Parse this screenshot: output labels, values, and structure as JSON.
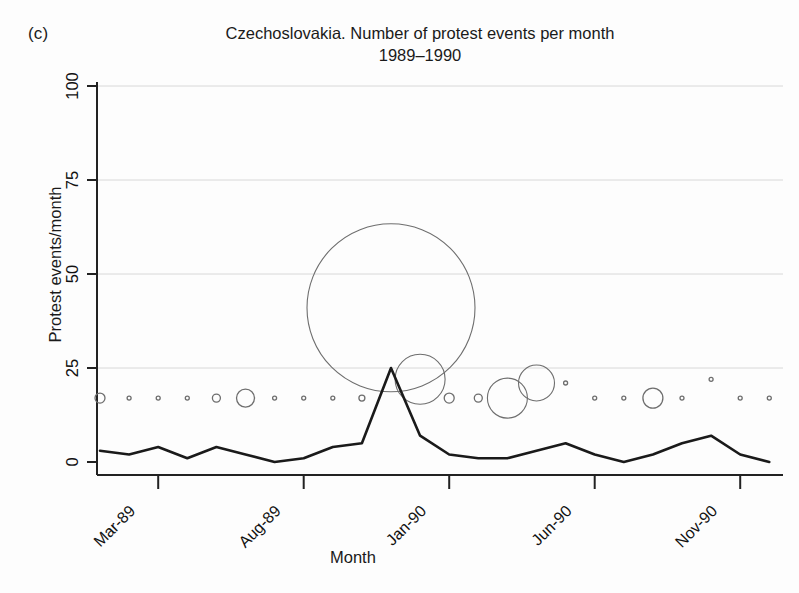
{
  "panel": {
    "label": "(c)"
  },
  "chart_data": {
    "type": "line",
    "title": "Czechoslovakia. Number of protest events per month",
    "subtitle": "1989–1990",
    "xlabel": "Month",
    "ylabel": "Protest events/month",
    "ylim": [
      0,
      100
    ],
    "yticks": [
      0,
      25,
      50,
      75,
      100
    ],
    "ytick_labels": [
      "0",
      "25",
      "50",
      "75",
      "100"
    ],
    "xticks": [
      "Mar-89",
      "Aug-89",
      "Jan-90",
      "Jun-90",
      "Nov-90"
    ],
    "xtick_months": [
      "1989-03",
      "1989-08",
      "1990-01",
      "1990-06",
      "1990-11"
    ],
    "grid": "horizontal-light",
    "legend": "none",
    "x": [
      "Jan-89",
      "Feb-89",
      "Mar-89",
      "Apr-89",
      "May-89",
      "Jun-89",
      "Jul-89",
      "Aug-89",
      "Sep-89",
      "Oct-89",
      "Nov-89",
      "Dec-89",
      "Jan-90",
      "Feb-90",
      "Mar-90",
      "Apr-90",
      "May-90",
      "Jun-90",
      "Jul-90",
      "Aug-90",
      "Sep-90",
      "Oct-90",
      "Nov-90",
      "Dec-90"
    ],
    "series": [
      {
        "name": "Protest events per month",
        "type": "line",
        "values": [
          3,
          2,
          4,
          1,
          4,
          2,
          0,
          1,
          4,
          5,
          25,
          7,
          2,
          1,
          1,
          3,
          5,
          2,
          0,
          2,
          5,
          7,
          2,
          0
        ]
      },
      {
        "name": "Event magnitude (bubble size)",
        "type": "bubble",
        "y_level": [
          17,
          17,
          17,
          17,
          17,
          17,
          17,
          17,
          17,
          17,
          41,
          22,
          17,
          17,
          17,
          21,
          21,
          17,
          17,
          17,
          17,
          22,
          17,
          17
        ],
        "radii": [
          5,
          2,
          2,
          2,
          4,
          9,
          2,
          2,
          2,
          3,
          84,
          25,
          5,
          4,
          20,
          18,
          2,
          2,
          2,
          10,
          2,
          2,
          2,
          2
        ]
      }
    ]
  }
}
